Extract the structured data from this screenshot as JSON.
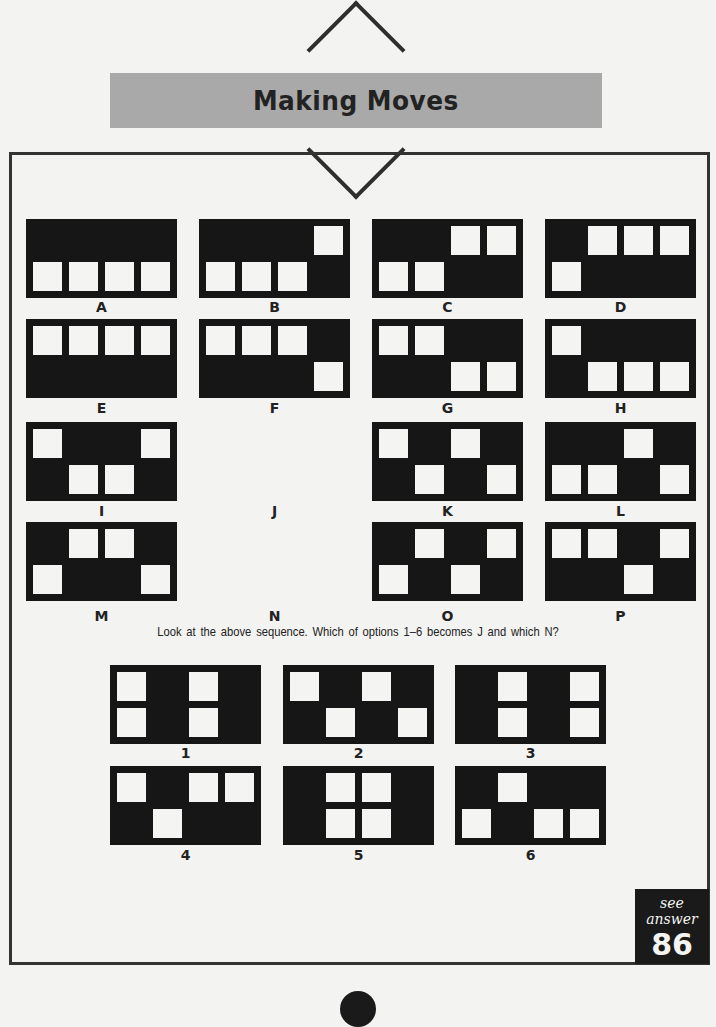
{
  "header": {
    "title": "Making Moves",
    "banner_color": "#a9a9a9"
  },
  "puzzle": {
    "grid": "2 rows x 4 columns of squares per panel; listed cells are white squares as [row, col]",
    "panels": [
      {
        "label": "A",
        "cells": [
          [
            2,
            1
          ],
          [
            2,
            2
          ],
          [
            2,
            3
          ],
          [
            2,
            4
          ]
        ]
      },
      {
        "label": "B",
        "cells": [
          [
            1,
            4
          ],
          [
            2,
            1
          ],
          [
            2,
            2
          ],
          [
            2,
            3
          ]
        ]
      },
      {
        "label": "C",
        "cells": [
          [
            1,
            3
          ],
          [
            1,
            4
          ],
          [
            2,
            1
          ],
          [
            2,
            2
          ]
        ]
      },
      {
        "label": "D",
        "cells": [
          [
            1,
            2
          ],
          [
            1,
            3
          ],
          [
            1,
            4
          ],
          [
            2,
            1
          ]
        ]
      },
      {
        "label": "E",
        "cells": [
          [
            1,
            1
          ],
          [
            1,
            2
          ],
          [
            1,
            3
          ],
          [
            1,
            4
          ]
        ]
      },
      {
        "label": "F",
        "cells": [
          [
            1,
            1
          ],
          [
            1,
            2
          ],
          [
            1,
            3
          ],
          [
            2,
            4
          ]
        ]
      },
      {
        "label": "G",
        "cells": [
          [
            1,
            1
          ],
          [
            1,
            2
          ],
          [
            2,
            3
          ],
          [
            2,
            4
          ]
        ]
      },
      {
        "label": "H",
        "cells": [
          [
            1,
            1
          ],
          [
            2,
            2
          ],
          [
            2,
            3
          ],
          [
            2,
            4
          ]
        ]
      },
      {
        "label": "I",
        "cells": [
          [
            1,
            1
          ],
          [
            1,
            4
          ],
          [
            2,
            2
          ],
          [
            2,
            3
          ]
        ]
      },
      {
        "label": "J",
        "cells": null
      },
      {
        "label": "K",
        "cells": [
          [
            1,
            1
          ],
          [
            1,
            3
          ],
          [
            2,
            2
          ],
          [
            2,
            4
          ]
        ]
      },
      {
        "label": "L",
        "cells": [
          [
            1,
            3
          ],
          [
            2,
            1
          ],
          [
            2,
            2
          ],
          [
            2,
            4
          ]
        ]
      },
      {
        "label": "M",
        "cells": [
          [
            1,
            2
          ],
          [
            1,
            3
          ],
          [
            2,
            1
          ],
          [
            2,
            4
          ]
        ]
      },
      {
        "label": "N",
        "cells": null
      },
      {
        "label": "O",
        "cells": [
          [
            1,
            2
          ],
          [
            1,
            4
          ],
          [
            2,
            1
          ],
          [
            2,
            3
          ]
        ]
      },
      {
        "label": "P",
        "cells": [
          [
            1,
            1
          ],
          [
            1,
            2
          ],
          [
            1,
            4
          ],
          [
            2,
            3
          ]
        ]
      }
    ],
    "question": "Look at the above sequence. Which of options  1–6 becomes J and which N?",
    "options": [
      {
        "label": "1",
        "cells": [
          [
            1,
            1
          ],
          [
            1,
            3
          ],
          [
            2,
            1
          ],
          [
            2,
            3
          ]
        ]
      },
      {
        "label": "2",
        "cells": [
          [
            1,
            1
          ],
          [
            1,
            3
          ],
          [
            2,
            2
          ],
          [
            2,
            4
          ]
        ]
      },
      {
        "label": "3",
        "cells": [
          [
            1,
            2
          ],
          [
            1,
            4
          ],
          [
            2,
            2
          ],
          [
            2,
            4
          ]
        ]
      },
      {
        "label": "4",
        "cells": [
          [
            1,
            1
          ],
          [
            1,
            3
          ],
          [
            1,
            4
          ],
          [
            2,
            2
          ]
        ]
      },
      {
        "label": "5",
        "cells": [
          [
            1,
            2
          ],
          [
            1,
            3
          ],
          [
            2,
            2
          ],
          [
            2,
            3
          ]
        ]
      },
      {
        "label": "6",
        "cells": [
          [
            1,
            2
          ],
          [
            2,
            1
          ],
          [
            2,
            3
          ],
          [
            2,
            4
          ]
        ]
      }
    ]
  },
  "answer": {
    "label": "see answer",
    "number": "86"
  }
}
